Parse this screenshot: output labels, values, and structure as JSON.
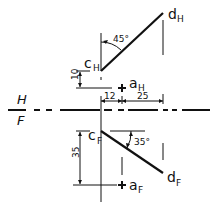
{
  "diagram": {
    "fold_line": {
      "top_label": "H",
      "bottom_label": "F"
    },
    "top_view": {
      "c_label": "c",
      "c_sub": "H",
      "d_label": "d",
      "d_sub": "H",
      "a_label": "a",
      "a_sub": "H",
      "angle_label": "45°",
      "dim_vertical": "10",
      "dim_left": "12",
      "dim_right": "25"
    },
    "front_view": {
      "c_label": "c",
      "c_sub": "F",
      "d_label": "d",
      "d_sub": "F",
      "a_label": "a",
      "a_sub": "F",
      "angle_label": "35°",
      "dim_vertical": "35"
    },
    "colors": {
      "ink": "#111111",
      "background": "#ffffff"
    }
  }
}
